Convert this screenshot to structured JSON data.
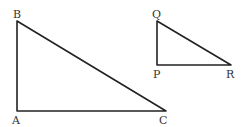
{
  "diagram": {
    "triangles": [
      {
        "name": "ABC",
        "vertices": {
          "A": {
            "label": "A",
            "x": 17,
            "y": 111
          },
          "B": {
            "label": "B",
            "x": 17,
            "y": 21
          },
          "C": {
            "label": "C",
            "x": 166,
            "y": 111
          }
        },
        "right_angle_at": "A"
      },
      {
        "name": "PQR",
        "vertices": {
          "P": {
            "label": "P",
            "x": 157,
            "y": 65
          },
          "Q": {
            "label": "Q",
            "x": 157,
            "y": 21
          },
          "R": {
            "label": "R",
            "x": 231,
            "y": 65
          }
        },
        "right_angle_at": "P"
      }
    ]
  }
}
